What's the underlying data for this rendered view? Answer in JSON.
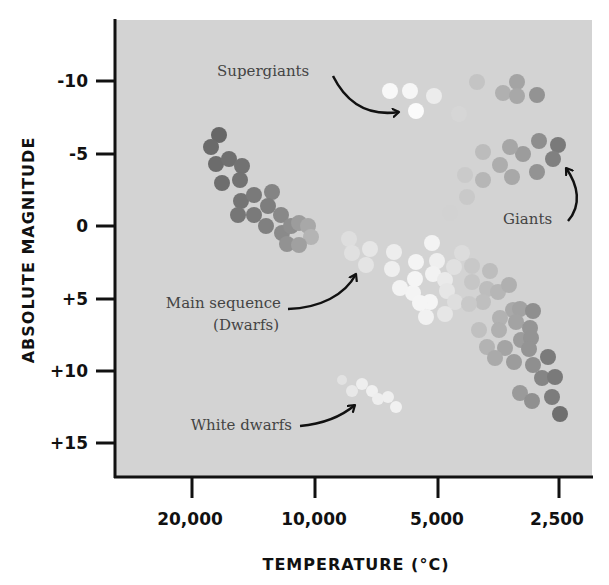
{
  "chart_data": {
    "type": "scatter",
    "title": "",
    "xlabel": "TEMPERATURE (°C)",
    "ylabel": "ABSOLUTE MAGNITUDE",
    "x_scale": "log",
    "x_reversed": true,
    "y_reversed": true,
    "x_ticks": [
      20000,
      10000,
      5000,
      2500
    ],
    "x_tick_labels": [
      "20,000",
      "10,000",
      "5,000",
      "2,500"
    ],
    "y_ticks": [
      -10,
      -5,
      0,
      5,
      10,
      15
    ],
    "y_tick_labels": [
      "-10",
      "-5",
      "0",
      "+5",
      "+10",
      "+15"
    ],
    "xlim": [
      32000,
      2000
    ],
    "ylim": [
      -14,
      17.5
    ],
    "grid": false,
    "legend": null,
    "background": "#d3d3d3",
    "annotations": [
      {
        "text": "Supergiants",
        "points_to": "supergiants"
      },
      {
        "text": "Giants",
        "points_to": "giants"
      },
      {
        "text": "Main sequence",
        "text2": "(Dwarfs)",
        "points_to": "main_sequence"
      },
      {
        "text": "White dwarfs",
        "points_to": "white_dwarfs"
      }
    ],
    "series": [
      {
        "name": "Supergiants",
        "points": [
          {
            "temperature": 6500,
            "magnitude": -9.4
          },
          {
            "temperature": 5800,
            "magnitude": -9.4
          },
          {
            "temperature": 5100,
            "magnitude": -9.1
          },
          {
            "temperature": 5600,
            "magnitude": -7.9
          },
          {
            "temperature": 4500,
            "magnitude": -7.7
          },
          {
            "temperature": 4100,
            "magnitude": -9.9
          },
          {
            "temperature": 3500,
            "magnitude": -9.8
          },
          {
            "temperature": 3200,
            "magnitude": -9.1
          },
          {
            "temperature": 3600,
            "magnitude": -9.2
          },
          {
            "temperature": 3000,
            "magnitude": -9.0
          }
        ]
      },
      {
        "name": "Giants",
        "points": [
          {
            "temperature": 2900,
            "magnitude": -5.9
          },
          {
            "temperature": 2600,
            "magnitude": -5.6
          },
          {
            "temperature": 2700,
            "magnitude": -4.6
          },
          {
            "temperature": 2900,
            "magnitude": -3.7
          },
          {
            "temperature": 3100,
            "magnitude": -5.0
          },
          {
            "temperature": 3300,
            "magnitude": -5.4
          },
          {
            "temperature": 3500,
            "magnitude": -4.2
          },
          {
            "temperature": 3300,
            "magnitude": -3.4
          },
          {
            "temperature": 3800,
            "magnitude": -5.1
          },
          {
            "temperature": 3800,
            "magnitude": -3.2
          },
          {
            "temperature": 4200,
            "magnitude": -3.5
          },
          {
            "temperature": 4100,
            "magnitude": -2.0
          },
          {
            "temperature": 4500,
            "magnitude": -0.9
          }
        ]
      },
      {
        "name": "Main sequence (Dwarfs)",
        "points": [
          {
            "temperature": 17800,
            "magnitude": -6.3
          },
          {
            "temperature": 18700,
            "magnitude": -5.4
          },
          {
            "temperature": 18200,
            "magnitude": -4.3
          },
          {
            "temperature": 16800,
            "magnitude": -4.6
          },
          {
            "temperature": 15700,
            "magnitude": -4.1
          },
          {
            "temperature": 17600,
            "magnitude": -2.9
          },
          {
            "temperature": 15900,
            "magnitude": -3.1
          },
          {
            "temperature": 15800,
            "magnitude": -1.7
          },
          {
            "temperature": 14700,
            "magnitude": -2.1
          },
          {
            "temperature": 13300,
            "magnitude": -2.3
          },
          {
            "temperature": 16100,
            "magnitude": -0.8
          },
          {
            "temperature": 14700,
            "magnitude": -0.8
          },
          {
            "temperature": 13600,
            "magnitude": -1.4
          },
          {
            "temperature": 13700,
            "magnitude": 0.0
          },
          {
            "temperature": 12700,
            "magnitude": -0.8
          },
          {
            "temperature": 12600,
            "magnitude": 0.5
          },
          {
            "temperature": 12000,
            "magnitude": 0.0
          },
          {
            "temperature": 12300,
            "magnitude": 1.2
          },
          {
            "temperature": 11500,
            "magnitude": -0.2
          },
          {
            "temperature": 10900,
            "magnitude": 0.0
          },
          {
            "temperature": 10700,
            "magnitude": 0.8
          },
          {
            "temperature": 11500,
            "magnitude": 1.3
          },
          {
            "temperature": 8900,
            "magnitude": 0.9
          },
          {
            "temperature": 8700,
            "magnitude": 1.9
          },
          {
            "temperature": 7800,
            "magnitude": 1.6
          },
          {
            "temperature": 8000,
            "magnitude": 2.7
          },
          {
            "temperature": 6900,
            "magnitude": 1.8
          },
          {
            "temperature": 7000,
            "magnitude": 3.0
          },
          {
            "temperature": 6100,
            "magnitude": 2.5
          },
          {
            "temperature": 6200,
            "magnitude": 4.6
          },
          {
            "temperature": 6700,
            "magnitude": 4.3
          },
          {
            "temperature": 6100,
            "magnitude": 3.7
          },
          {
            "temperature": 5300,
            "magnitude": 2.4
          },
          {
            "temperature": 5500,
            "magnitude": 3.3
          },
          {
            "temperature": 5100,
            "magnitude": 3.7
          },
          {
            "temperature": 5700,
            "magnitude": 5.2
          },
          {
            "temperature": 5000,
            "magnitude": 4.5
          },
          {
            "temperature": 5900,
            "magnitude": 6.3
          },
          {
            "temperature": 4800,
            "magnitude": 5.2
          },
          {
            "temperature": 5100,
            "magnitude": 6.1
          },
          {
            "temperature": 6100,
            "magnitude": 5.3
          },
          {
            "temperature": 4800,
            "magnitude": 2.8
          },
          {
            "temperature": 5500,
            "magnitude": 1.2
          },
          {
            "temperature": 4500,
            "magnitude": 1.9
          },
          {
            "temperature": 4600,
            "magnitude": 2.8
          },
          {
            "temperature": 4100,
            "magnitude": 3.1
          },
          {
            "temperature": 4600,
            "magnitude": 3.9
          },
          {
            "temperature": 4200,
            "magnitude": 4.4
          },
          {
            "temperature": 3900,
            "magnitude": 4.6
          },
          {
            "temperature": 3700,
            "magnitude": 4.1
          },
          {
            "temperature": 4300,
            "magnitude": 5.2
          },
          {
            "temperature": 4800,
            "magnitude": 5.3
          },
          {
            "temperature": 3600,
            "magnitude": 5.8
          },
          {
            "temperature": 3500,
            "magnitude": 5.8
          },
          {
            "temperature": 3300,
            "magnitude": 5.9
          },
          {
            "temperature": 4000,
            "magnitude": 6.3
          },
          {
            "temperature": 3600,
            "magnitude": 6.6
          },
          {
            "temperature": 3400,
            "magnitude": 7.0
          },
          {
            "temperature": 4600,
            "magnitude": 7.2
          },
          {
            "temperature": 4000,
            "magnitude": 7.2
          },
          {
            "temperature": 3500,
            "magnitude": 7.9
          },
          {
            "temperature": 3300,
            "magnitude": 7.7
          },
          {
            "temperature": 4400,
            "magnitude": 8.3
          },
          {
            "temperature": 4100,
            "magnitude": 8.3
          },
          {
            "temperature": 3600,
            "magnitude": 8.5
          },
          {
            "temperature": 3900,
            "magnitude": 9.1
          },
          {
            "temperature": 3700,
            "magnitude": 9.4
          },
          {
            "temperature": 2900,
            "magnitude": 9.0
          },
          {
            "temperature": 3200,
            "magnitude": 9.6
          },
          {
            "temperature": 3000,
            "magnitude": 10.5
          },
          {
            "temperature": 2800,
            "magnitude": 10.4
          },
          {
            "temperature": 3400,
            "magnitude": 11.5
          },
          {
            "temperature": 3200,
            "magnitude": 12.1
          },
          {
            "temperature": 2900,
            "magnitude": 11.8
          },
          {
            "temperature": 2700,
            "magnitude": 13.0
          }
        ]
      },
      {
        "name": "White dwarfs",
        "points": [
          {
            "temperature": 9100,
            "magnitude": 10.6
          },
          {
            "temperature": 8600,
            "magnitude": 11.3
          },
          {
            "temperature": 8100,
            "magnitude": 10.9
          },
          {
            "temperature": 7700,
            "magnitude": 11.4
          },
          {
            "temperature": 7400,
            "magnitude": 11.9
          },
          {
            "temperature": 6800,
            "magnitude": 11.8
          },
          {
            "temperature": 6500,
            "magnitude": 12.5
          }
        ]
      }
    ]
  },
  "render": {
    "dot_radius": 8,
    "dots": [
      {
        "x": 390,
        "y": 91,
        "c": "#f8f8f8"
      },
      {
        "x": 410,
        "y": 91,
        "c": "#f6f6f6"
      },
      {
        "x": 434,
        "y": 96,
        "c": "#ececec"
      },
      {
        "x": 416,
        "y": 111,
        "c": "#fbfbfb"
      },
      {
        "x": 459,
        "y": 114,
        "c": "#d6d6d6"
      },
      {
        "x": 477,
        "y": 82,
        "c": "#c4c4c4"
      },
      {
        "x": 517,
        "y": 82,
        "c": "#a4a4a4"
      },
      {
        "x": 503,
        "y": 93,
        "c": "#b0b0b0"
      },
      {
        "x": 537,
        "y": 95,
        "c": "#939393"
      },
      {
        "x": 517,
        "y": 96,
        "c": "#a8a8a8"
      },
      {
        "x": 539,
        "y": 141,
        "c": "#8e8e8e"
      },
      {
        "x": 558,
        "y": 145,
        "c": "#7a7a7a"
      },
      {
        "x": 553,
        "y": 159,
        "c": "#808080"
      },
      {
        "x": 537,
        "y": 172,
        "c": "#939393"
      },
      {
        "x": 523,
        "y": 154,
        "c": "#9c9c9c"
      },
      {
        "x": 510,
        "y": 147,
        "c": "#a6a6a6"
      },
      {
        "x": 500,
        "y": 165,
        "c": "#adadad"
      },
      {
        "x": 512,
        "y": 177,
        "c": "#a8a8a8"
      },
      {
        "x": 483,
        "y": 152,
        "c": "#bcbcbc"
      },
      {
        "x": 483,
        "y": 180,
        "c": "#b6b6b6"
      },
      {
        "x": 465,
        "y": 175,
        "c": "#cacaca"
      },
      {
        "x": 467,
        "y": 197,
        "c": "#c9c9c9"
      },
      {
        "x": 450,
        "y": 213,
        "c": "#d2d2d2"
      },
      {
        "x": 219,
        "y": 135,
        "c": "#676767"
      },
      {
        "x": 211,
        "y": 147,
        "c": "#6a6a6a"
      },
      {
        "x": 216,
        "y": 164,
        "c": "#6c6c6c"
      },
      {
        "x": 229,
        "y": 159,
        "c": "#6f6f6f"
      },
      {
        "x": 242,
        "y": 166,
        "c": "#727272"
      },
      {
        "x": 222,
        "y": 183,
        "c": "#6e6e6e"
      },
      {
        "x": 240,
        "y": 180,
        "c": "#727272"
      },
      {
        "x": 241,
        "y": 201,
        "c": "#747474"
      },
      {
        "x": 254,
        "y": 195,
        "c": "#7a7a7a"
      },
      {
        "x": 272,
        "y": 192,
        "c": "#848484"
      },
      {
        "x": 238,
        "y": 215,
        "c": "#767676"
      },
      {
        "x": 254,
        "y": 215,
        "c": "#7a7a7a"
      },
      {
        "x": 268,
        "y": 206,
        "c": "#7e7e7e"
      },
      {
        "x": 266,
        "y": 226,
        "c": "#808080"
      },
      {
        "x": 281,
        "y": 215,
        "c": "#888888"
      },
      {
        "x": 282,
        "y": 233,
        "c": "#8a8a8a"
      },
      {
        "x": 291,
        "y": 226,
        "c": "#8e8e8e"
      },
      {
        "x": 287,
        "y": 244,
        "c": "#929292"
      },
      {
        "x": 299,
        "y": 223,
        "c": "#9c9c9c"
      },
      {
        "x": 308,
        "y": 226,
        "c": "#a8a8a8"
      },
      {
        "x": 311,
        "y": 237,
        "c": "#b4b4b4"
      },
      {
        "x": 299,
        "y": 245,
        "c": "#a0a0a0"
      },
      {
        "x": 349,
        "y": 239,
        "c": "#dedede"
      },
      {
        "x": 352,
        "y": 253,
        "c": "#e0e0e0"
      },
      {
        "x": 370,
        "y": 249,
        "c": "#e6e6e6"
      },
      {
        "x": 366,
        "y": 265,
        "c": "#e4e4e4"
      },
      {
        "x": 394,
        "y": 252,
        "c": "#ededed"
      },
      {
        "x": 392,
        "y": 269,
        "c": "#efefef"
      },
      {
        "x": 416,
        "y": 262,
        "c": "#f4f4f4"
      },
      {
        "x": 413,
        "y": 293,
        "c": "#f4f4f4"
      },
      {
        "x": 400,
        "y": 288,
        "c": "#f3f3f3"
      },
      {
        "x": 415,
        "y": 279,
        "c": "#f5f5f5"
      },
      {
        "x": 437,
        "y": 261,
        "c": "#efefef"
      },
      {
        "x": 433,
        "y": 274,
        "c": "#f2f2f2"
      },
      {
        "x": 445,
        "y": 280,
        "c": "#eaeaea"
      },
      {
        "x": 430,
        "y": 302,
        "c": "#f5f5f5"
      },
      {
        "x": 447,
        "y": 291,
        "c": "#e6e6e6"
      },
      {
        "x": 426,
        "y": 317,
        "c": "#f1f1f1"
      },
      {
        "x": 455,
        "y": 302,
        "c": "#dedede"
      },
      {
        "x": 445,
        "y": 314,
        "c": "#e6e6e6"
      },
      {
        "x": 420,
        "y": 303,
        "c": "#f5f5f5"
      },
      {
        "x": 454,
        "y": 267,
        "c": "#e0e0e0"
      },
      {
        "x": 432,
        "y": 243,
        "c": "#f3f3f3"
      },
      {
        "x": 462,
        "y": 253,
        "c": "#dcdcdc"
      },
      {
        "x": 472,
        "y": 266,
        "c": "#c8c8c8"
      },
      {
        "x": 490,
        "y": 271,
        "c": "#bdbdbd"
      },
      {
        "x": 472,
        "y": 282,
        "c": "#c6c6c6"
      },
      {
        "x": 487,
        "y": 289,
        "c": "#bdbdbd"
      },
      {
        "x": 498,
        "y": 292,
        "c": "#b6b6b6"
      },
      {
        "x": 509,
        "y": 285,
        "c": "#b0b0b0"
      },
      {
        "x": 483,
        "y": 302,
        "c": "#bfbfbf"
      },
      {
        "x": 469,
        "y": 304,
        "c": "#c9c9c9"
      },
      {
        "x": 513,
        "y": 310,
        "c": "#a9a9a9"
      },
      {
        "x": 520,
        "y": 309,
        "c": "#a2a2a2"
      },
      {
        "x": 533,
        "y": 311,
        "c": "#8f8f8f"
      },
      {
        "x": 500,
        "y": 318,
        "c": "#b2b2b2"
      },
      {
        "x": 516,
        "y": 322,
        "c": "#a3a3a3"
      },
      {
        "x": 530,
        "y": 328,
        "c": "#959595"
      },
      {
        "x": 479,
        "y": 330,
        "c": "#c0c0c0"
      },
      {
        "x": 499,
        "y": 330,
        "c": "#b0b0b0"
      },
      {
        "x": 521,
        "y": 340,
        "c": "#9c9c9c"
      },
      {
        "x": 531,
        "y": 338,
        "c": "#949494"
      },
      {
        "x": 487,
        "y": 347,
        "c": "#b3b3b3"
      },
      {
        "x": 505,
        "y": 348,
        "c": "#a4a4a4"
      },
      {
        "x": 529,
        "y": 349,
        "c": "#949494"
      },
      {
        "x": 495,
        "y": 358,
        "c": "#aaaaaa"
      },
      {
        "x": 514,
        "y": 362,
        "c": "#9c9c9c"
      },
      {
        "x": 548,
        "y": 357,
        "c": "#7b7b7b"
      },
      {
        "x": 533,
        "y": 365,
        "c": "#8f8f8f"
      },
      {
        "x": 542,
        "y": 378,
        "c": "#858585"
      },
      {
        "x": 555,
        "y": 377,
        "c": "#7a7a7a"
      },
      {
        "x": 520,
        "y": 393,
        "c": "#9a9a9a"
      },
      {
        "x": 532,
        "y": 401,
        "c": "#909090"
      },
      {
        "x": 552,
        "y": 397,
        "c": "#7c7c7c"
      },
      {
        "x": 560,
        "y": 414,
        "c": "#6f6f6f"
      },
      {
        "x": 342,
        "y": 380,
        "c": "#e2e2e2",
        "r": 5
      },
      {
        "x": 352,
        "y": 391,
        "c": "#e8e8e8",
        "r": 6
      },
      {
        "x": 362,
        "y": 384,
        "c": "#eeeeee",
        "r": 6
      },
      {
        "x": 372,
        "y": 391,
        "c": "#f0f0f0",
        "r": 6
      },
      {
        "x": 378,
        "y": 399,
        "c": "#eeeeee",
        "r": 6
      },
      {
        "x": 388,
        "y": 397,
        "c": "#efefef",
        "r": 6
      },
      {
        "x": 396,
        "y": 407,
        "c": "#f1f1f1",
        "r": 6
      }
    ]
  },
  "labels": {
    "supergiants": "Supergiants",
    "giants": "Giants",
    "main_sequence_1": "Main sequence",
    "main_sequence_2": "(Dwarfs)",
    "white_dwarfs": "White dwarfs"
  }
}
